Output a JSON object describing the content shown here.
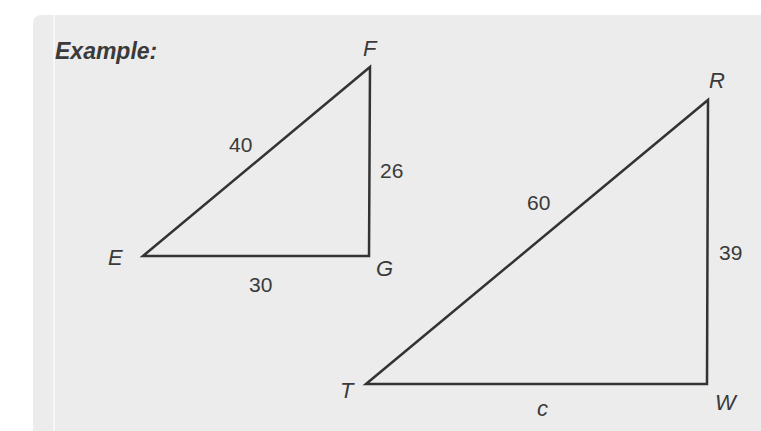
{
  "title": "Example:",
  "colors": {
    "background": "#ececec",
    "line": "#333333",
    "text": "#3a3a3a"
  },
  "triangles": [
    {
      "name": "EFG",
      "vertices": {
        "E": "E",
        "F": "F",
        "G": "G"
      },
      "sides": {
        "EF": "40",
        "FG": "26",
        "EG": "30"
      },
      "right_angle_at": "G"
    },
    {
      "name": "RTW",
      "vertices": {
        "R": "R",
        "T": "T",
        "W": "W"
      },
      "sides": {
        "RT": "60",
        "RW": "39",
        "TW": "c"
      },
      "right_angle_at": "W"
    }
  ]
}
